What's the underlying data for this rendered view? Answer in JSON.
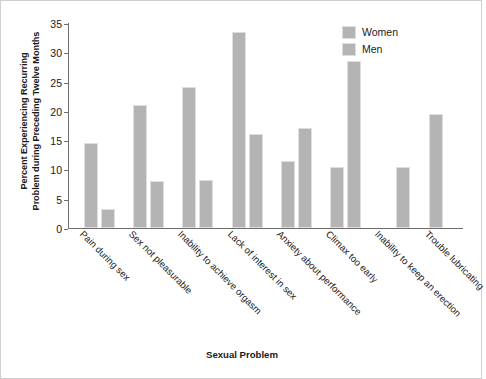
{
  "chart_data": {
    "type": "bar",
    "title": "",
    "xlabel": "Sexual Problem",
    "ylabel": "Percent Experiencing Recurring Problem during Preceding Twelve Months",
    "ylabel_line1": "Percent Experiencing Recurring",
    "ylabel_line2": "Problem during Preceding Twelve Months",
    "categories": [
      "Pain during sex",
      "Sex not pleasurable",
      "Inability to achieve orgasm",
      "Lack of interest in sex",
      "Anxiety about performance",
      "Climax too early",
      "Inability to keep an erection",
      "Trouble lubricating"
    ],
    "series": [
      {
        "name": "Women",
        "values": [
          14.5,
          21.0,
          24.0,
          33.5,
          11.5,
          10.5,
          null,
          19.5
        ],
        "color": "#b4b4b4"
      },
      {
        "name": "Men",
        "values": [
          3.2,
          8.0,
          8.2,
          16.0,
          17.0,
          28.5,
          10.4,
          null
        ],
        "color": "#b4b4b4"
      }
    ],
    "ylim": [
      0,
      35
    ],
    "yticks": [
      0,
      5,
      10,
      15,
      20,
      25,
      30,
      35
    ],
    "ytick_labels": [
      "0",
      "5",
      "10",
      "15",
      "20",
      "25",
      "30",
      "35"
    ],
    "grid": false,
    "legend_position": "top-right",
    "legend_entries": [
      "Women",
      "Men"
    ]
  },
  "legend": {
    "items": [
      {
        "label": "Women",
        "swatch": "legend-swatch-women"
      },
      {
        "label": "Men",
        "swatch": "legend-swatch-men"
      }
    ]
  }
}
